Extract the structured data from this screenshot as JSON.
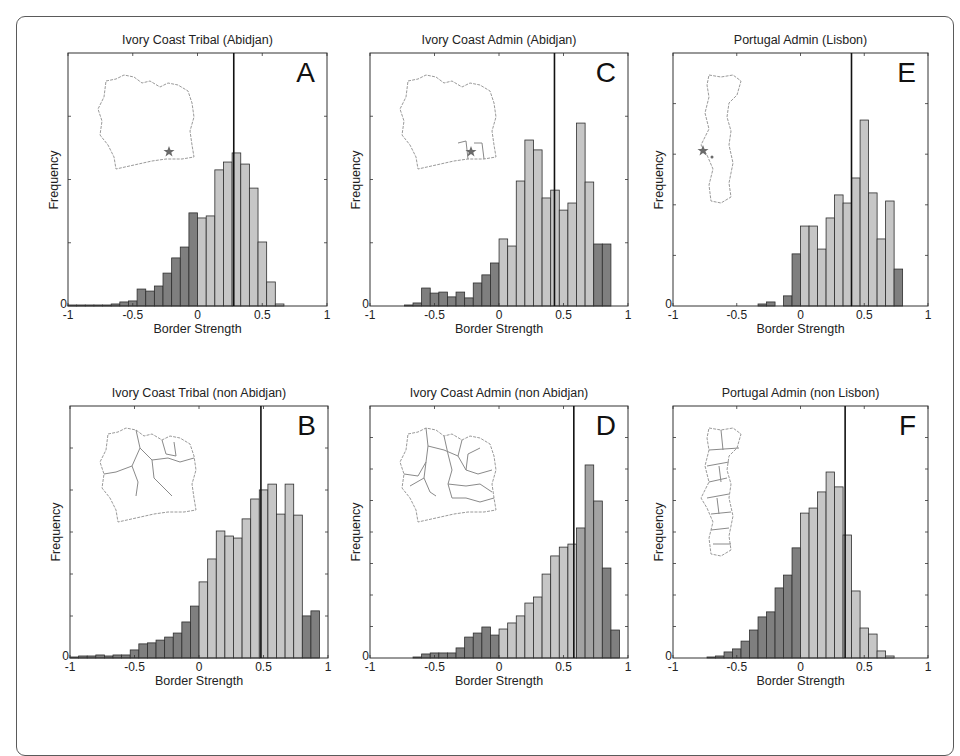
{
  "colors": {
    "bar_dark": "#7f7f7f",
    "bar_light": "#c6c6c6",
    "bar_edge": "#2e2e2e",
    "median_line": "#111111",
    "axis": "#333333",
    "map_outline": "#9a9a9a",
    "star": "#6a6a6a"
  },
  "common": {
    "xlabel": "Border Strength",
    "ylabel": "Frequency",
    "y_zero_label": "0",
    "x_tick_labels": [
      "-1",
      "-0.5",
      "0",
      "0.5",
      "1"
    ]
  },
  "chart_data": [
    {
      "id": "A",
      "type": "bar",
      "title": "Ivory Coast Tribal (Abidjan)",
      "panel_letter": "A",
      "xlabel": "Border Strength",
      "ylabel": "Frequency",
      "xlim": [
        -1,
        1
      ],
      "xticks": [
        -1,
        -0.5,
        0,
        0.5,
        1
      ],
      "yticks_labeled": [
        "0"
      ],
      "grid": false,
      "bin_width": 0.0667,
      "bin_start": -1,
      "vertical_line_x": 0.28,
      "inset_map": "Ivory Coast outline with star at Abidjan",
      "heights_rel": [
        0.004,
        0.004,
        0.004,
        0.004,
        0.004,
        0.008,
        0.016,
        0.02,
        0.067,
        0.059,
        0.079,
        0.13,
        0.19,
        0.233,
        0.368,
        0.348,
        0.356,
        0.538,
        0.569,
        0.605,
        0.561,
        0.466,
        0.253,
        0.095,
        0.008,
        0,
        0,
        0,
        0,
        0
      ],
      "dark_bins": [
        0,
        1,
        2,
        3,
        4,
        5,
        6,
        7,
        8,
        9,
        10,
        11,
        12,
        13,
        14
      ]
    },
    {
      "id": "C",
      "type": "bar",
      "title": "Ivory Coast Admin (Abidjan)",
      "panel_letter": "C",
      "xlabel": "Border Strength",
      "ylabel": "Frequency",
      "xlim": [
        -1,
        1
      ],
      "xticks": [
        -1,
        -0.5,
        0,
        0.5,
        1
      ],
      "yticks_labeled": [
        "0"
      ],
      "grid": false,
      "bin_width": 0.0667,
      "bin_start": -1,
      "vertical_line_x": 0.43,
      "inset_map": "Ivory Coast outline with Abidjan admin region and star",
      "heights_rel": [
        0,
        0,
        0,
        0,
        0.004,
        0.012,
        0.071,
        0.051,
        0.055,
        0.036,
        0.055,
        0.032,
        0.091,
        0.123,
        0.17,
        0.265,
        0.237,
        0.494,
        0.656,
        0.617,
        0.427,
        0.458,
        0.379,
        0.407,
        0.723,
        0.49,
        0.245,
        0.245,
        0,
        0
      ],
      "dark_bins": [
        4,
        5,
        6,
        7,
        8,
        9,
        10,
        11,
        12,
        13,
        14,
        26,
        27
      ]
    },
    {
      "id": "E",
      "type": "bar",
      "title": "Portugal Admin (Lisbon)",
      "panel_letter": "E",
      "xlabel": "Border Strength",
      "ylabel": "Frequency",
      "xlim": [
        -1,
        1
      ],
      "xticks": [
        -1,
        -0.5,
        0,
        0.5,
        1
      ],
      "yticks_labeled": [
        "0"
      ],
      "grid": false,
      "bin_width": 0.0667,
      "bin_start": -1,
      "vertical_line_x": 0.4,
      "inset_map": "Portugal outline with star at Lisbon",
      "heights_rel": [
        0,
        0,
        0,
        0,
        0,
        0,
        0,
        0,
        0,
        0,
        0.008,
        0.016,
        0,
        0.04,
        0.206,
        0.316,
        0.316,
        0.225,
        0.348,
        0.439,
        0.407,
        0.506,
        0.735,
        0.447,
        0.265,
        0.415,
        0.146,
        0,
        0,
        0
      ],
      "dark_bins": [
        10,
        11,
        12,
        13,
        14,
        26
      ]
    },
    {
      "id": "B",
      "type": "bar",
      "title": "Ivory Coast Tribal (non Abidjan)",
      "panel_letter": "B",
      "xlabel": "Border Strength",
      "ylabel": "Frequency",
      "xlim": [
        -1,
        1
      ],
      "xticks": [
        -1,
        -0.5,
        0,
        0.5,
        1
      ],
      "yticks_labeled": [
        "0"
      ],
      "grid": false,
      "bin_width": 0.0667,
      "bin_start": -1,
      "vertical_line_x": 0.48,
      "inset_map": "Ivory Coast tribal region borders (excluding Abidjan)",
      "heights_rel": [
        0.004,
        0.008,
        0.008,
        0.012,
        0.008,
        0.012,
        0.012,
        0.032,
        0.056,
        0.06,
        0.071,
        0.083,
        0.099,
        0.143,
        0.206,
        0.302,
        0.393,
        0.504,
        0.484,
        0.476,
        0.552,
        0.631,
        0.667,
        0.69,
        0.571,
        0.69,
        0.567,
        0.167,
        0.187,
        0
      ],
      "dark_bins": [
        0,
        1,
        2,
        3,
        4,
        5,
        6,
        7,
        8,
        9,
        10,
        11,
        12,
        13,
        14,
        27,
        28
      ]
    },
    {
      "id": "D",
      "type": "bar",
      "title": "Ivory Coast Admin (non Abidjan)",
      "panel_letter": "D",
      "xlabel": "Border Strength",
      "ylabel": "Frequency",
      "xlim": [
        -1,
        1
      ],
      "xticks": [
        -1,
        -0.5,
        0,
        0.5,
        1
      ],
      "yticks_labeled": [
        "0"
      ],
      "grid": false,
      "bin_width": 0.0667,
      "bin_start": -1,
      "vertical_line_x": 0.58,
      "inset_map": "Ivory Coast admin region borders (excluding Abidjan)",
      "heights_rel": [
        0,
        0,
        0,
        0,
        0,
        0.004,
        0.016,
        0.02,
        0.02,
        0.02,
        0.04,
        0.083,
        0.099,
        0.123,
        0.091,
        0.115,
        0.139,
        0.167,
        0.218,
        0.242,
        0.333,
        0.405,
        0.44,
        0.452,
        0.516,
        0.766,
        0.623,
        0.357,
        0.111,
        0
      ],
      "dark_bins": [
        5,
        6,
        7,
        8,
        9,
        10,
        11,
        12,
        13,
        14,
        27,
        28
      ],
      "mid_bins": [
        24,
        25,
        26
      ]
    },
    {
      "id": "F",
      "type": "bar",
      "title": "Portugal Admin (non Lisbon)",
      "panel_letter": "F",
      "xlabel": "Border Strength",
      "ylabel": "Frequency",
      "xlim": [
        -1,
        1
      ],
      "xticks": [
        -1,
        -0.5,
        0,
        0.5,
        1
      ],
      "yticks_labeled": [
        "0"
      ],
      "grid": false,
      "bin_width": 0.0667,
      "bin_start": -1,
      "vertical_line_x": 0.35,
      "inset_map": "Portugal admin region borders (excluding Lisbon)",
      "heights_rel": [
        0,
        0,
        0,
        0,
        0.004,
        0.008,
        0.024,
        0.036,
        0.067,
        0.111,
        0.163,
        0.183,
        0.278,
        0.329,
        0.437,
        0.575,
        0.595,
        0.659,
        0.738,
        0.679,
        0.488,
        0.266,
        0.119,
        0.095,
        0.028,
        0.008,
        0,
        0,
        0,
        0
      ],
      "dark_bins": [
        4,
        5,
        6,
        7,
        8,
        9,
        10,
        11,
        12,
        13,
        14
      ]
    }
  ],
  "layout": {
    "panels": [
      {
        "id": "A",
        "x0": 68,
        "x1": 327,
        "y0": 53,
        "y1": 306,
        "yticks": 4,
        "map": "ivory"
      },
      {
        "id": "C",
        "x0": 370,
        "x1": 628,
        "y0": 53,
        "y1": 306,
        "yticks": 4,
        "map": "ivory-admin"
      },
      {
        "id": "E",
        "x0": 673,
        "x1": 928,
        "y0": 53,
        "y1": 306,
        "yticks": 5,
        "map": "portugal"
      },
      {
        "id": "B",
        "x0": 70,
        "x1": 328,
        "y0": 406,
        "y1": 658,
        "yticks": 6,
        "map": "ivory-tribal"
      },
      {
        "id": "D",
        "x0": 370,
        "x1": 628,
        "y0": 406,
        "y1": 658,
        "yticks": 8,
        "map": "ivory-admin-full"
      },
      {
        "id": "F",
        "x0": 673,
        "x1": 928,
        "y0": 406,
        "y1": 658,
        "yticks": 8,
        "map": "portugal-admin"
      }
    ]
  }
}
